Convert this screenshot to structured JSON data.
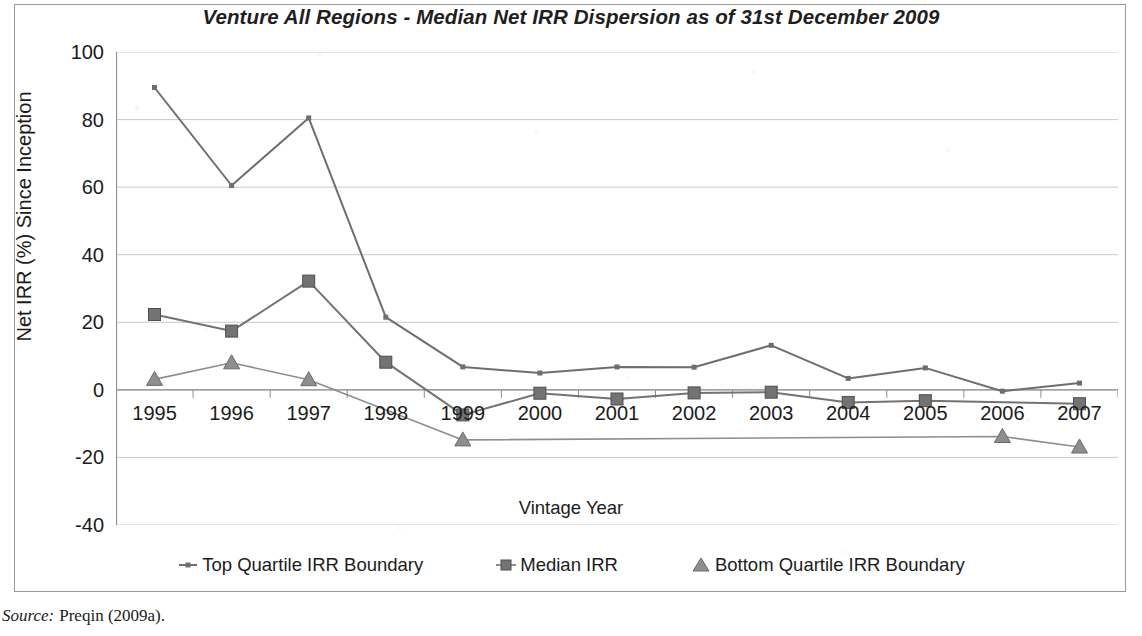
{
  "chart_data": {
    "type": "line",
    "title": "Venture All Regions - Median Net IRR Dispersion as of 31st December 2009",
    "xlabel": "Vintage Year",
    "ylabel": "Net IRR (%) Since Inception",
    "categories": [
      "1995",
      "1996",
      "1997",
      "1998",
      "1999",
      "2000",
      "2001",
      "2002",
      "2003",
      "2004",
      "2005",
      "2006",
      "2007"
    ],
    "ylim": [
      -40,
      100
    ],
    "yticks": [
      100,
      80,
      60,
      40,
      20,
      0,
      -20,
      -40
    ],
    "grid": true,
    "legend_position": "bottom",
    "series": [
      {
        "name": "Top Quartile IRR Boundary",
        "marker": "dash",
        "color": "#6e6e6e",
        "values": [
          89.5,
          60.5,
          80.5,
          21.5,
          6.8,
          5.0,
          6.8,
          6.7,
          13.2,
          3.4,
          6.5,
          -0.4,
          2.0
        ]
      },
      {
        "name": "Median IRR",
        "marker": "square",
        "color": "#737373",
        "values": [
          22.3,
          17.4,
          32.2,
          8.2,
          -7.4,
          -1.0,
          -2.7,
          -0.9,
          -0.7,
          -3.7,
          -3.2,
          null,
          -4.1
        ]
      },
      {
        "name": "Bottom Quartile IRR Boundary",
        "marker": "triangle",
        "color": "#8e8e8e",
        "values": [
          3.1,
          8.0,
          3.0,
          null,
          -14.8,
          null,
          null,
          null,
          null,
          null,
          null,
          -13.8,
          -16.9
        ]
      }
    ]
  },
  "source": {
    "label": "Source:",
    "text": "Preqin (2009a)."
  },
  "colors": {
    "top_quartile": "#6e6e6e",
    "median": "#737373",
    "bottom_quartile": "#8e8e8e",
    "grid": "#c9c9c9",
    "axis": "#8d8d8d",
    "frame": "#9a9a9a"
  }
}
